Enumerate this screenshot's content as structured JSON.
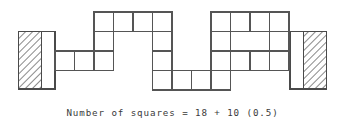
{
  "figure": {
    "caption": "Number of squares = 18 + 10 (0.5)",
    "caption_parts": {
      "label": "Number of squares",
      "equals": "=",
      "whole_squares": "18",
      "plus": "+",
      "half_count": "10",
      "half_value": "(0.5)"
    },
    "colors": {
      "background": "#ffffff",
      "grid_line": "#555555",
      "outline": "#444444",
      "hatch_line": "#777777",
      "caption_text": "#3a3a3a"
    },
    "geometry": {
      "cell_size": 19.5,
      "grid_origin_x": 55,
      "grid_origin_y": 12,
      "columns": 11,
      "rows": 4
    },
    "whole_squares_count": 18,
    "half_squares_count": 10,
    "unit_squares": [
      {
        "col": 0,
        "row": 2
      },
      {
        "col": 1,
        "row": 2
      },
      {
        "col": 2,
        "row": 0
      },
      {
        "col": 2,
        "row": 1
      },
      {
        "col": 2,
        "row": 2
      },
      {
        "col": 3,
        "row": 0
      },
      {
        "col": 4,
        "row": 0
      },
      {
        "col": 5,
        "row": 0
      },
      {
        "col": 5,
        "row": 1
      },
      {
        "col": 5,
        "row": 2
      },
      {
        "col": 5,
        "row": 3
      },
      {
        "col": 6,
        "row": 3
      },
      {
        "col": 7,
        "row": 3
      },
      {
        "col": 8,
        "row": 0
      },
      {
        "col": 8,
        "row": 1
      },
      {
        "col": 8,
        "row": 2
      },
      {
        "col": 8,
        "row": 3
      },
      {
        "col": 9,
        "row": 0
      },
      {
        "col": 10,
        "row": 0
      },
      {
        "col": 11,
        "row": 0
      },
      {
        "col": 11,
        "row": 1
      },
      {
        "col": 11,
        "row": 2
      },
      {
        "col": 12,
        "row": 2
      },
      {
        "col": 13,
        "row": 2
      }
    ],
    "end_blocks": [
      {
        "name": "left-end-block",
        "x": 18,
        "y": 31,
        "width": 37,
        "height": 58,
        "hatched_side": "left",
        "hatch_width": 23,
        "plain_width": 14
      },
      {
        "name": "right-end-block",
        "x": 290,
        "y": 31,
        "width": 37,
        "height": 58,
        "hatched_side": "right",
        "hatch_width": 23,
        "plain_width": 14
      }
    ]
  }
}
